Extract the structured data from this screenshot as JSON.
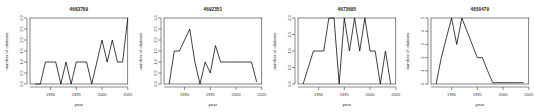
{
  "figure": {
    "background": "#ffffff",
    "line_color": "#000000",
    "axis_color": "#2c2c2c",
    "panel_count": 4
  },
  "chart_data": [
    {
      "type": "line",
      "title": "4663769",
      "xlabel": "year",
      "ylabel": "number of citations",
      "xlim": [
        1986,
        2005
      ],
      "ylim": [
        0.0,
        3.0
      ],
      "xticks": [
        1990,
        1995,
        2000,
        2005
      ],
      "yticks": [
        0.0,
        0.5,
        1.0,
        1.5,
        2.0,
        2.5,
        3.0
      ],
      "ytick_labels": [
        "0.0",
        "0.5",
        "1.0",
        "1.5",
        "2.0",
        "2.5",
        "3.0"
      ],
      "grid": false,
      "legend": "none",
      "x": [
        1987,
        1988,
        1989,
        1990,
        1991,
        1992,
        1993,
        1994,
        1995,
        1996,
        1997,
        1998,
        1999,
        2000,
        2001,
        2002,
        2003,
        2004,
        2005
      ],
      "y": [
        0,
        0,
        1,
        1,
        1,
        0,
        1,
        0,
        1,
        1,
        1,
        0,
        1,
        2,
        1,
        2,
        1,
        1,
        3
      ]
    },
    {
      "type": "line",
      "title": "4692351",
      "xlabel": "year",
      "ylabel": "number of citations",
      "xlim": [
        1986,
        2005
      ],
      "ylim": [
        0.0,
        3.0
      ],
      "xticks": [
        1990,
        1995,
        2000,
        2005
      ],
      "yticks": [
        0.0,
        0.5,
        1.0,
        1.5,
        2.0,
        2.5,
        3.0
      ],
      "ytick_labels": [
        "0.0",
        "0.5",
        "1.0",
        "1.5",
        "2.0",
        "2.5",
        "3.0"
      ],
      "grid": false,
      "legend": "none",
      "x": [
        1987,
        1988,
        1989,
        1990,
        1991,
        1992,
        1993,
        1994,
        1995,
        1996,
        1997,
        1998,
        1999,
        2000,
        2001,
        2002,
        2003,
        2004
      ],
      "y": [
        0,
        1.5,
        1.5,
        2,
        2.5,
        1,
        0,
        1,
        0.5,
        1.75,
        1,
        1,
        1,
        1,
        1,
        1,
        1,
        0.1
      ]
    },
    {
      "type": "line",
      "title": "4673695",
      "xlabel": "year",
      "ylabel": "number of citations",
      "xlim": [
        1986,
        2005
      ],
      "ylim": [
        0.0,
        2.0
      ],
      "xticks": [
        1990,
        1995,
        2000,
        2005
      ],
      "yticks": [
        0.0,
        0.5,
        1.0,
        1.5,
        2.0
      ],
      "ytick_labels": [
        "0.0",
        "0.5",
        "1.0",
        "1.5",
        "2.0"
      ],
      "grid": false,
      "legend": "none",
      "x": [
        1987,
        1988,
        1989,
        1990,
        1991,
        1992,
        1993,
        1994,
        1995,
        1996,
        1997,
        1998,
        1999,
        2000,
        2001,
        2002,
        2003,
        2004
      ],
      "y": [
        0,
        0.5,
        1,
        1,
        1,
        2,
        2,
        0,
        2,
        1,
        2,
        1,
        2,
        1,
        1,
        0,
        1,
        0
      ]
    },
    {
      "type": "line",
      "title": "4650479",
      "xlabel": "year",
      "ylabel": "number of citations",
      "xlim": [
        1986,
        2005
      ],
      "ylim": [
        0,
        5
      ],
      "xticks": [
        1990,
        1995,
        2000,
        2005
      ],
      "yticks": [
        0,
        1,
        2,
        3,
        4,
        5
      ],
      "ytick_labels": [
        "0",
        "1",
        "2",
        "3",
        "4",
        "5"
      ],
      "grid": false,
      "legend": "none",
      "x": [
        1987,
        1988,
        1989,
        1990,
        1991,
        1992,
        1993,
        1994,
        1995,
        1996,
        1997,
        1998,
        1999,
        2000,
        2001,
        2002,
        2003,
        2004
      ],
      "y": [
        0,
        2,
        3.5,
        5,
        3,
        5,
        4,
        3,
        2,
        2,
        1,
        0.1,
        0.1,
        0.1,
        0.1,
        0.1,
        0.1,
        0.1
      ]
    }
  ]
}
